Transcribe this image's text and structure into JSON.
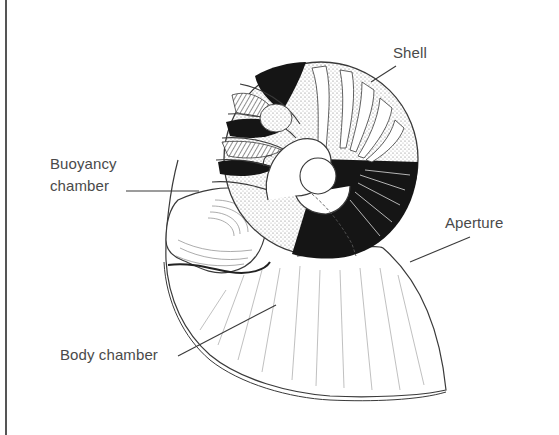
{
  "figure": {
    "labels": {
      "shell": "Shell",
      "buoyancy_line1": "Buoyancy",
      "buoyancy_line2": "chamber",
      "aperture": "Aperture",
      "body_chamber": "Body chamber"
    },
    "colors": {
      "line": "#3a3a3a",
      "label_text": "#4a4a4a",
      "dark_fill": "#151515",
      "stipple": "#bdbdbd",
      "background": "#ffffff"
    }
  }
}
